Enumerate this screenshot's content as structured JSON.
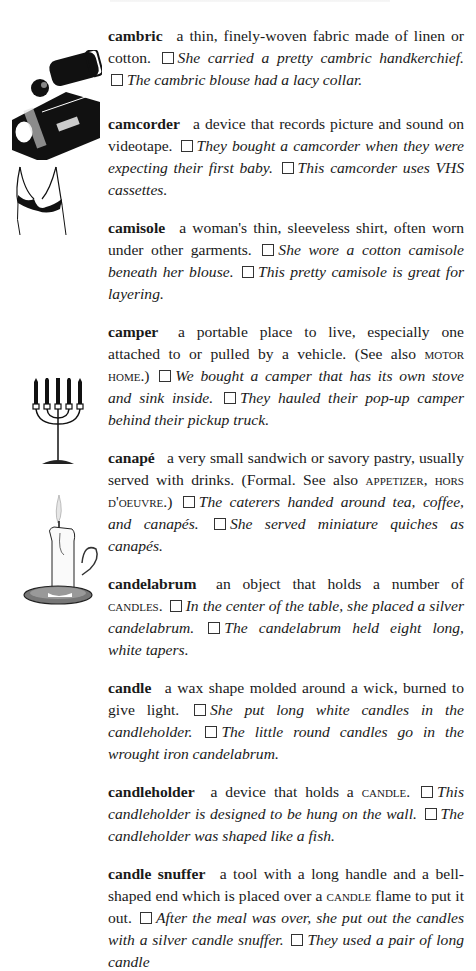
{
  "page": {
    "entries": [
      {
        "headword": "cambric",
        "definition": "a thin, finely-woven fabric made of linen or cotton.",
        "examples": [
          "She carried a pretty cambric handkerchief.",
          "The cambric blouse had a lacy collar."
        ]
      },
      {
        "headword": "camcorder",
        "definition": "a device that records picture and sound on videotape.",
        "examples": [
          "They bought a camcorder when they were expecting their first baby.",
          "This camcorder uses VHS cassettes."
        ]
      },
      {
        "headword": "camisole",
        "definition": "a woman's thin, sleeveless shirt, often worn under other garments.",
        "examples": [
          "She wore a cotton camisole beneath her blouse.",
          "This pretty camisole is great for layering."
        ]
      },
      {
        "headword": "camper",
        "definition": "a portable place to live, especially one attached to or pulled by a vehicle. (See also",
        "crossref": "MOTOR HOME",
        "definition_end": ".)",
        "examples": [
          "We bought a camper that has its own stove and sink inside.",
          "They hauled their pop-up camper behind their pickup truck."
        ]
      },
      {
        "headword": "canapé",
        "definition": "a very small sandwich or savory pastry, usually served with drinks. (Formal. See also",
        "crossref": "APPETIZER, HORS D'OEUVRE",
        "definition_end": ".)",
        "examples": [
          "The caterers handed around tea, coffee, and canapés.",
          "She served miniature quiches as canapés."
        ]
      },
      {
        "headword": "candelabrum",
        "definition": "an object that holds a number of",
        "crossref": "CANDLES",
        "definition_end": ".",
        "examples": [
          "In the center of the table, she placed a silver candelabrum.",
          "The candelabrum held eight long, white tapers."
        ]
      },
      {
        "headword": "candle",
        "definition": "a wax shape molded around a wick, burned to give light.",
        "examples": [
          "She put long white candles in the candleholder.",
          "The little round candles go in the wrought iron candelabrum."
        ]
      },
      {
        "headword": "candleholder",
        "definition": "a device that holds a",
        "crossref": "CANDLE",
        "definition_end": ".",
        "examples": [
          "This candleholder is designed to be hung on the wall.",
          "The candleholder was shaped like a fish."
        ]
      },
      {
        "headword": "candle snuffer",
        "definition": "a tool with a long handle and a bell-shaped end which is placed over a",
        "crossref": "CANDLE",
        "definition_end": "flame to put it out.",
        "examples": [
          "After the meal was over, she put out the candles with a silver candle snuffer.",
          "They used a pair of long candle"
        ]
      }
    ],
    "illustrations": [
      "camcorder-illustration",
      "camisole-illustration",
      "candelabrum-illustration",
      "candle-illustration"
    ]
  }
}
